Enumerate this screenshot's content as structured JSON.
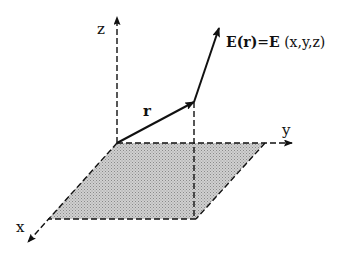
{
  "diagram": {
    "axes": {
      "x_label": "x",
      "y_label": "y",
      "z_label": "z"
    },
    "vectors": {
      "position_label": "r",
      "field_label_bold_left": "E",
      "field_label_arg": "(r)",
      "field_label_eq": "=",
      "field_label_bold_right": "E",
      "field_label_coords": " (x,y,z)"
    },
    "colors": {
      "line": "#111111",
      "plane_fill": "#bdbdbd",
      "background": "#ffffff"
    }
  }
}
